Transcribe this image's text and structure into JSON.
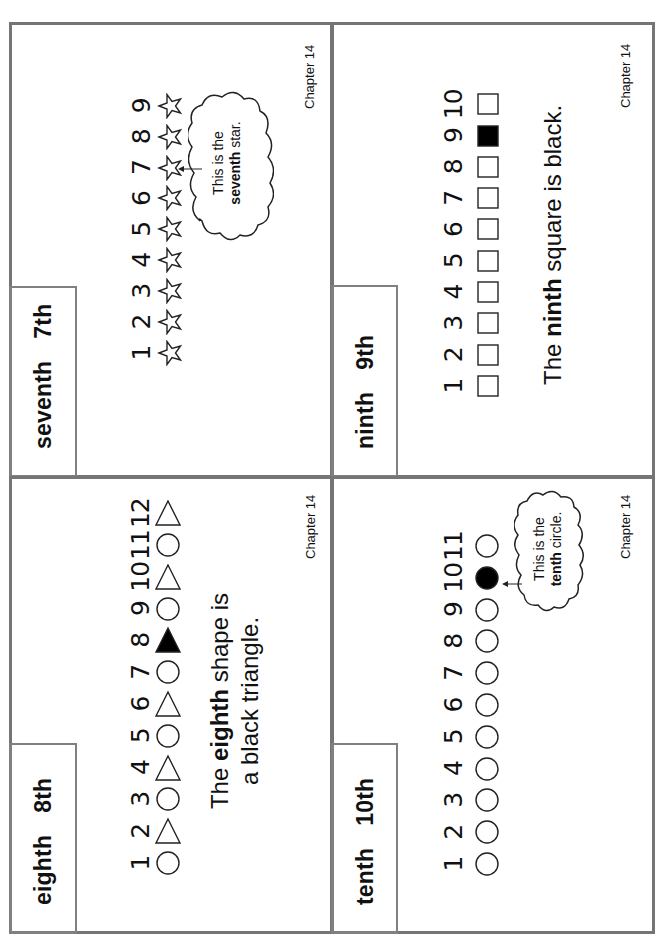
{
  "page": {
    "panels": [
      {
        "id": "seventh",
        "word": "seventh",
        "ordinal": "7th",
        "numbers": [
          "1",
          "2",
          "3",
          "4",
          "5",
          "6",
          "7",
          "8",
          "9"
        ],
        "shapes": [
          "star",
          "star",
          "star",
          "star",
          "star",
          "star",
          "star",
          "star",
          "star"
        ],
        "highlight_index": 7,
        "callout": {
          "line1": "This is the",
          "bold": "seventh",
          "rest": " star."
        },
        "footer": "Chapter 14"
      },
      {
        "id": "ninth",
        "word": "ninth",
        "ordinal": "9th",
        "numbers": [
          "1",
          "2",
          "3",
          "4",
          "5",
          "6",
          "7",
          "8",
          "9",
          "10"
        ],
        "shapes": [
          "square",
          "square",
          "square",
          "square",
          "square",
          "square",
          "square",
          "square",
          "square-filled",
          "square"
        ],
        "sentence": {
          "pre": "The ",
          "bold": "ninth",
          "post": " square is black."
        },
        "footer": "Chapter 14"
      },
      {
        "id": "eighth",
        "word": "eighth",
        "ordinal": "8th",
        "numbers": [
          "1",
          "2",
          "3",
          "4",
          "5",
          "6",
          "7",
          "8",
          "9",
          "10",
          "11",
          "12"
        ],
        "shapes": [
          "circle",
          "triangle",
          "circle",
          "triangle",
          "circle",
          "triangle",
          "circle",
          "triangle-filled",
          "circle",
          "triangle",
          "circle",
          "triangle"
        ],
        "sentence": {
          "pre": "The ",
          "bold": "eighth",
          "post": " shape is",
          "line2": "a black triangle."
        },
        "footer": "Chapter 14"
      },
      {
        "id": "tenth",
        "word": "tenth",
        "ordinal": "10th",
        "numbers": [
          "1",
          "2",
          "3",
          "4",
          "5",
          "6",
          "7",
          "8",
          "9",
          "10",
          "11"
        ],
        "shapes": [
          "circle",
          "circle",
          "circle",
          "circle",
          "circle",
          "circle",
          "circle",
          "circle",
          "circle",
          "circle-filled",
          "circle"
        ],
        "highlight_index": 10,
        "callout": {
          "line1": "This is the",
          "bold": "tenth",
          "rest": " circle."
        },
        "footer": "Chapter 14"
      }
    ],
    "colors": {
      "border": "#757575",
      "ink": "#111111",
      "fill": "#000000"
    }
  }
}
